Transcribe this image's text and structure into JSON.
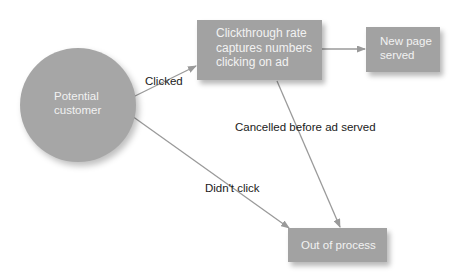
{
  "diagram": {
    "nodes": {
      "potential_customer": {
        "lines": [
          "Potential",
          "customer"
        ]
      },
      "clickthrough": {
        "lines": [
          "Clickthrough rate",
          "captures numbers",
          "clicking on ad"
        ]
      },
      "new_page": {
        "lines": [
          "New page",
          "served"
        ]
      },
      "out_of_process": {
        "lines": [
          "Out of process"
        ]
      }
    },
    "edges": {
      "clicked": {
        "label": "Clicked"
      },
      "cancelled": {
        "label": "Cancelled before ad served"
      },
      "didnt_click": {
        "label": "Didn't click"
      },
      "to_new_page": {
        "label": ""
      }
    },
    "colors": {
      "node_fill": "#a2a2a2",
      "node_text": "#f2f2f2",
      "arrow": "#9a9a9a",
      "label_text": "#1a1a1a"
    }
  }
}
